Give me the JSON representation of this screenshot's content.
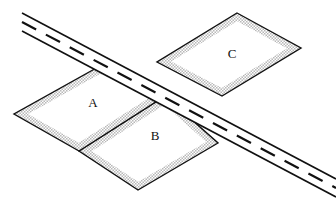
{
  "figure": {
    "kind": "land-parcel-road-diagram",
    "width": 336,
    "height": 199,
    "background_color": "#ffffff"
  },
  "style": {
    "outline_color": "#111111",
    "parcel_fill_color": "#ffffff",
    "border_band_color": "#cfcfcf",
    "road_fill_color": "#ffffff",
    "road_edge_color": "#111111",
    "centerline_color": "#111111",
    "label_color": "#111111",
    "outline_width": 1.4,
    "band_width": 7,
    "road_edge_width": 1.6,
    "centerline_width": 2.2
  },
  "parcels": [
    {
      "id": "A",
      "label": "A",
      "label_x": 93,
      "label_y": 104,
      "points": "100,66 165,96 79,151 14,114",
      "z": 2
    },
    {
      "id": "B",
      "label": "B",
      "label_x": 155,
      "label_y": 137,
      "points": "165,96 218,143 138,190 79,151",
      "z": 1
    },
    {
      "id": "C",
      "label": "C",
      "label_x": 232,
      "label_y": 55,
      "points": "237,13 301,48 222,96 157,62",
      "z": 3
    }
  ],
  "road": {
    "name": "diagonal-road",
    "edge_top": "22,13 336,179",
    "edge_bottom": "22,31 336,197",
    "centerline": "22,22 336,188",
    "dash_pattern": "16 11",
    "description": "two-lane road running from upper-left to lower-right with dashed center stripe"
  },
  "labels": {
    "a": "A",
    "b": "B",
    "c": "C"
  }
}
